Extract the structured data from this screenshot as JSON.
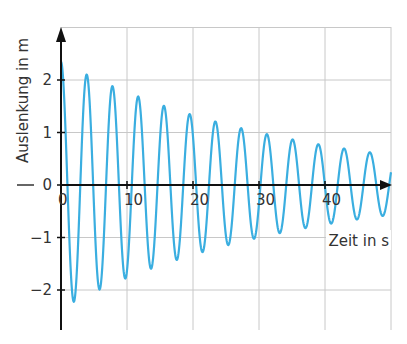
{
  "chart_data": {
    "type": "line",
    "title": "",
    "xlabel": "Zeit in s",
    "ylabel": "Auslenkung in m",
    "xlim": [
      0,
      50
    ],
    "ylim": [
      -2.8,
      3
    ],
    "grid": true,
    "x_ticks": [
      0,
      10,
      20,
      30,
      40
    ],
    "x_tick_labels": [
      "0",
      "10",
      "20",
      "30",
      "40"
    ],
    "y_ticks": [
      2,
      1,
      0,
      -1,
      -2
    ],
    "y_tick_labels": [
      "2",
      "1",
      "0",
      "−1",
      "−2"
    ],
    "grid_x": [
      0,
      10,
      20,
      30,
      40,
      50
    ],
    "grid_y": [
      3,
      2,
      1,
      0,
      -1,
      -2
    ],
    "legend": null,
    "series": [
      {
        "name": "Auslenkung",
        "color": "#3aaee0",
        "model": "y = A * exp(-delta * t) * cos(2*pi*t/T)",
        "A": 2.35,
        "delta": 0.0284,
        "T": 3.9,
        "t_start": 0,
        "t_end": 50,
        "peaks": [
          {
            "t": 0.0,
            "y": 2.0
          },
          {
            "t": 3.8,
            "y": 2.13
          },
          {
            "t": 7.7,
            "y": 1.88
          },
          {
            "t": 11.7,
            "y": 1.68
          },
          {
            "t": 15.6,
            "y": 1.5
          },
          {
            "t": 19.6,
            "y": 1.37
          },
          {
            "t": 23.5,
            "y": 1.22
          },
          {
            "t": 27.3,
            "y": 1.09
          },
          {
            "t": 31.2,
            "y": 0.97
          },
          {
            "t": 35.2,
            "y": 0.86
          },
          {
            "t": 38.9,
            "y": 0.76
          },
          {
            "t": 42.9,
            "y": 0.69
          },
          {
            "t": 46.8,
            "y": 0.63
          }
        ],
        "troughs": [
          {
            "t": 1.9,
            "y": -2.2
          },
          {
            "t": 5.8,
            "y": -2.0
          },
          {
            "t": 9.8,
            "y": -1.75
          },
          {
            "t": 13.7,
            "y": -1.55
          },
          {
            "t": 17.6,
            "y": -1.4
          },
          {
            "t": 21.6,
            "y": -1.3
          },
          {
            "t": 25.5,
            "y": -1.22
          },
          {
            "t": 29.3,
            "y": -1.05
          },
          {
            "t": 33.2,
            "y": -0.93
          },
          {
            "t": 37.2,
            "y": -0.82
          },
          {
            "t": 40.9,
            "y": -0.74
          },
          {
            "t": 44.8,
            "y": -0.69
          },
          {
            "t": 48.8,
            "y": -0.61
          }
        ]
      }
    ]
  },
  "colors": {
    "curve": "#3aaee0",
    "axis": "#111111",
    "grid": "#c8c8c8",
    "text": "#333333"
  },
  "labels": {
    "x_axis_title": "Zeit in s",
    "y_axis_title": "Auslenkung in m"
  }
}
